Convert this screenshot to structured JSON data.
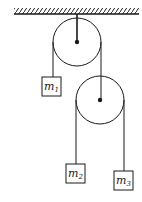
{
  "diagram": {
    "type": "pulley-system",
    "colors": {
      "ink": "#1a1a1a",
      "background": "#ffffff"
    },
    "ceiling": {
      "x1": 14,
      "x2": 139,
      "y": 14
    },
    "pulleys": [
      {
        "id": "top",
        "cx": 77,
        "cy": 42,
        "r": 24
      },
      {
        "id": "lower",
        "cx": 100,
        "cy": 100,
        "r": 24
      }
    ],
    "masses": [
      {
        "id": "m1",
        "label": "m",
        "subscript": "1",
        "x": 42,
        "y": 77,
        "w": 19,
        "h": 19
      },
      {
        "id": "m2",
        "label": "m",
        "subscript": "2",
        "x": 66,
        "y": 164,
        "w": 19,
        "h": 19
      },
      {
        "id": "m3",
        "label": "m",
        "subscript": "3",
        "x": 114,
        "y": 171,
        "w": 19,
        "h": 19
      }
    ]
  }
}
